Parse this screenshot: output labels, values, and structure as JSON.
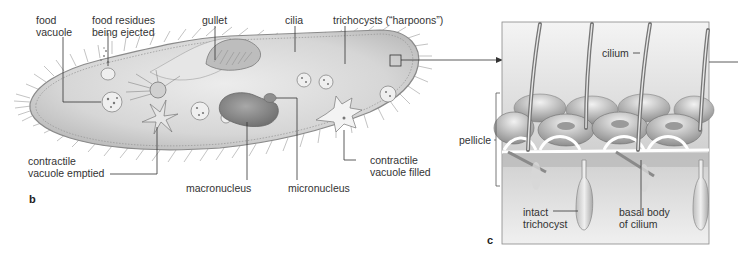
{
  "figure": {
    "panel_b": {
      "letter": "b",
      "labels": {
        "food_vacuole_1": "food",
        "food_vacuole_2": "vacuole",
        "food_residues_1": "food residues",
        "food_residues_2": "being ejected",
        "gullet": "gullet",
        "cilia": "cilia",
        "trichocysts": "trichocysts (“harpoons”)",
        "contractile_emptied_1": "contractile",
        "contractile_emptied_2": "vacuole emptied",
        "macronucleus": "macronucleus",
        "micronucleus": "micronucleus",
        "contractile_filled_1": "contractile",
        "contractile_filled_2": "vacuole filled"
      }
    },
    "panel_c": {
      "letter": "c",
      "labels": {
        "cilium": "cilium",
        "pellicle": "pellicle",
        "intact_1": "intact",
        "intact_2": "trichocyst",
        "basal_1": "basal body",
        "basal_2": "of cilium"
      }
    },
    "colors": {
      "body_fill": "#d9d9d9",
      "body_stroke": "#8a8a8a",
      "nucleus": "#8f8f8f",
      "leader_line": "#333333",
      "panel_bg": "#e6e6e6"
    }
  }
}
